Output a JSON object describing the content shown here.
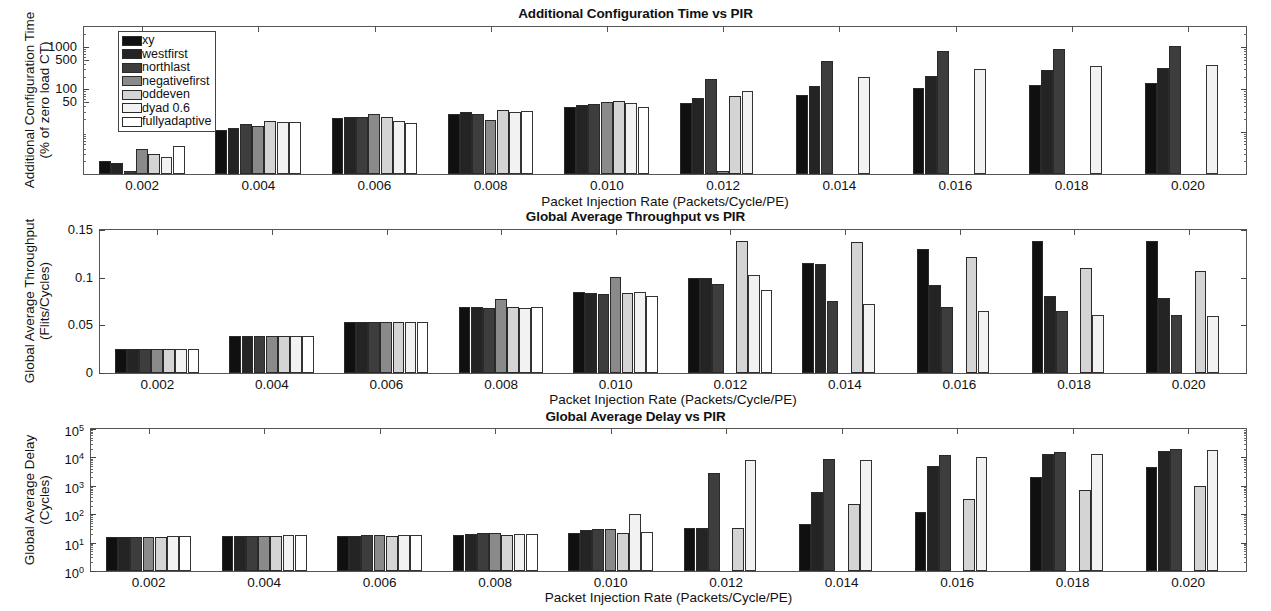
{
  "figure": {
    "width": 1271,
    "height": 611,
    "background": "#ffffff"
  },
  "series_colors": {
    "xy": "#101010",
    "westfirst": "#242424",
    "northlast": "#3d3d3d",
    "negativefirst": "#8a8a8a",
    "oddeven": "#d4d4d4",
    "dyad 0.6": "#f2f2f2",
    "fullyadaptive": "#ffffff"
  },
  "legend": {
    "position": "top-left-inside-panel-1",
    "entries": [
      {
        "label": "xy",
        "color": "#101010"
      },
      {
        "label": "westfirst",
        "color": "#242424"
      },
      {
        "label": "northlast",
        "color": "#3d3d3d"
      },
      {
        "label": "negativefirst",
        "color": "#8a8a8a"
      },
      {
        "label": "oddeven",
        "color": "#d4d4d4"
      },
      {
        "label": "dyad 0.6",
        "color": "#f2f2f2"
      },
      {
        "label": "fullyadaptive",
        "color": "#ffffff"
      }
    ]
  },
  "shared": {
    "xlabel": "Packet Injection Rate (Packets/Cycle/PE)",
    "categories": [
      "0.002",
      "0.004",
      "0.006",
      "0.008",
      "0.010",
      "0.012",
      "0.014",
      "0.016",
      "0.018",
      "0.020"
    ]
  },
  "chart_data": [
    {
      "type": "bar",
      "id": "additional-configuration-time",
      "title": "Additional Configuration Time vs PIR",
      "xlabel": "Packet Injection Rate (Packets/Cycle/PE)",
      "ylabel": "Additional Configuration Time (% of zero load CT)",
      "ylabel_line1": "Additional Configuration Time",
      "ylabel_line2": "(% of zero load CT)",
      "yscale": "log",
      "ylim": [
        1,
        3000
      ],
      "ytick_labels": [
        "1000",
        "500",
        "100",
        "50"
      ],
      "ytick_values": [
        1000,
        500,
        100,
        50
      ],
      "grid": false,
      "categories": [
        "0.002",
        "0.004",
        "0.006",
        "0.008",
        "0.010",
        "0.012",
        "0.014",
        "0.016",
        "0.018",
        "0.020"
      ],
      "series": [
        {
          "name": "xy",
          "values": [
            2.0,
            11,
            21,
            27,
            38,
            49,
            75,
            110,
            125,
            145
          ]
        },
        {
          "name": "westfirst",
          "values": [
            1.8,
            12,
            22,
            30,
            42,
            62,
            120,
            210,
            290,
            330
          ]
        },
        {
          "name": "northlast",
          "values": [
            1.2,
            15,
            22,
            26,
            45,
            175,
            480,
            830,
            900,
            1050
          ]
        },
        {
          "name": "negativefirst",
          "values": [
            4.0,
            14,
            26,
            19,
            50,
            1.2,
            1.0,
            1.0,
            1.0,
            1.0
          ]
        },
        {
          "name": "oddeven",
          "values": [
            3.0,
            18,
            22,
            32,
            52,
            70,
            1.0,
            1.0,
            1.0,
            1.0
          ]
        },
        {
          "name": "dyad 0.6",
          "values": [
            2.5,
            17,
            18,
            30,
            48,
            90,
            200,
            310,
            360,
            380
          ]
        },
        {
          "name": "fullyadaptive",
          "values": [
            4.5,
            17,
            16,
            31,
            38,
            1.0,
            1.0,
            1.0,
            1.0,
            1.0
          ]
        }
      ]
    },
    {
      "type": "bar",
      "id": "global-average-throughput",
      "title": "Global Average Throughput vs PIR",
      "xlabel": "Packet Injection Rate (Packets/Cycle/PE)",
      "ylabel": "Global Average Throughput (Flits/Cycles)",
      "ylabel_line1": "Global Average Throughput",
      "ylabel_line2": "(Flits/Cycles)",
      "yscale": "linear",
      "ylim": [
        0,
        0.15
      ],
      "ytick_labels": [
        "0",
        "0.05",
        "0.1",
        "0.15"
      ],
      "ytick_values": [
        0,
        0.05,
        0.1,
        0.15
      ],
      "grid": false,
      "categories": [
        "0.002",
        "0.004",
        "0.006",
        "0.008",
        "0.010",
        "0.012",
        "0.014",
        "0.016",
        "0.018",
        "0.020"
      ],
      "series": [
        {
          "name": "xy",
          "values": [
            0.025,
            0.039,
            0.053,
            0.069,
            0.085,
            0.1,
            0.115,
            0.13,
            0.139,
            0.139
          ]
        },
        {
          "name": "westfirst",
          "values": [
            0.025,
            0.039,
            0.053,
            0.069,
            0.084,
            0.1,
            0.114,
            0.092,
            0.081,
            0.079
          ]
        },
        {
          "name": "northlast",
          "values": [
            0.025,
            0.039,
            0.053,
            0.068,
            0.083,
            0.093,
            0.076,
            0.069,
            0.065,
            0.061
          ]
        },
        {
          "name": "negativefirst",
          "values": [
            0.025,
            0.039,
            0.053,
            0.078,
            0.101,
            0.0,
            0.0,
            0.0,
            0.0,
            0.0
          ]
        },
        {
          "name": "oddeven",
          "values": [
            0.025,
            0.039,
            0.053,
            0.069,
            0.084,
            0.138,
            0.137,
            0.122,
            0.11,
            0.107
          ]
        },
        {
          "name": "dyad 0.6",
          "values": [
            0.025,
            0.039,
            0.053,
            0.068,
            0.085,
            0.103,
            0.072,
            0.065,
            0.061,
            0.06
          ]
        },
        {
          "name": "fullyadaptive",
          "values": [
            0.025,
            0.039,
            0.053,
            0.069,
            0.081,
            0.087,
            0.0,
            0.0,
            0.0,
            0.0
          ]
        }
      ]
    },
    {
      "type": "bar",
      "id": "global-average-delay",
      "title": "Global Average Delay vs PIR",
      "xlabel": "Packet Injection Rate (Packets/Cycle/PE)",
      "ylabel": "Global Average Delay (Cycles)",
      "ylabel_line1": "Global Average Delay",
      "ylabel_line2": "(Cycles)",
      "yscale": "log",
      "ylim": [
        1,
        100000
      ],
      "ytick_labels": [
        "10^0",
        "10^1",
        "10^2",
        "10^3",
        "10^4",
        "10^5"
      ],
      "ytick_bases": [
        "10",
        "10",
        "10",
        "10",
        "10",
        "10"
      ],
      "ytick_exponents": [
        "0",
        "1",
        "2",
        "3",
        "4",
        "5"
      ],
      "ytick_values": [
        1,
        10,
        100,
        1000,
        10000,
        100000
      ],
      "grid": false,
      "categories": [
        "0.002",
        "0.004",
        "0.006",
        "0.008",
        "0.010",
        "0.012",
        "0.014",
        "0.016",
        "0.018",
        "0.020"
      ],
      "series": [
        {
          "name": "xy",
          "values": [
            16,
            17,
            17,
            19,
            22,
            32,
            45,
            120,
            2000,
            4500
          ]
        },
        {
          "name": "westfirst",
          "values": [
            16,
            17,
            17,
            20,
            28,
            33,
            600,
            5000,
            13000,
            17000
          ]
        },
        {
          "name": "northlast",
          "values": [
            16,
            17,
            18,
            21,
            30,
            2800,
            9000,
            12000,
            16000,
            19000
          ]
        },
        {
          "name": "negativefirst",
          "values": [
            16,
            17,
            18,
            21,
            30,
            1.0,
            1.0,
            1.0,
            1.0,
            1.0
          ]
        },
        {
          "name": "oddeven",
          "values": [
            16,
            17,
            17,
            19,
            22,
            34,
            220,
            340,
            700,
            1000
          ]
        },
        {
          "name": "dyad 0.6",
          "values": [
            17,
            18,
            18,
            20,
            100,
            8000,
            8000,
            10000,
            13000,
            18000
          ]
        },
        {
          "name": "fullyadaptive",
          "values": [
            17,
            18,
            18,
            20,
            24,
            1.0,
            1.0,
            1.0,
            1.0,
            1.0
          ]
        }
      ]
    }
  ]
}
